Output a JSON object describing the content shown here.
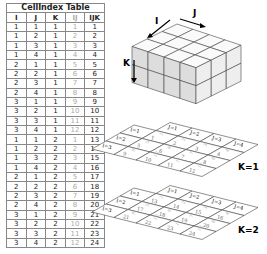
{
  "table": {
    "title": "CellIndex Table",
    "headers": [
      "I",
      "J",
      "K",
      "IJ",
      "IJK"
    ],
    "rows": [
      [
        1,
        1,
        1,
        1,
        1
      ],
      [
        1,
        2,
        1,
        2,
        2
      ],
      [
        1,
        3,
        1,
        3,
        3
      ],
      [
        1,
        4,
        1,
        4,
        4
      ],
      [
        2,
        1,
        1,
        5,
        5
      ],
      [
        2,
        2,
        1,
        6,
        6
      ],
      [
        2,
        3,
        1,
        7,
        7
      ],
      [
        2,
        4,
        1,
        8,
        8
      ],
      [
        3,
        1,
        1,
        9,
        9
      ],
      [
        3,
        2,
        1,
        10,
        10
      ],
      [
        3,
        3,
        1,
        11,
        11
      ],
      [
        3,
        4,
        1,
        12,
        12
      ],
      [
        1,
        1,
        2,
        1,
        13
      ],
      [
        1,
        2,
        2,
        2,
        14
      ],
      [
        1,
        3,
        2,
        3,
        15
      ],
      [
        1,
        4,
        2,
        4,
        16
      ],
      [
        2,
        1,
        2,
        5,
        17
      ],
      [
        2,
        2,
        2,
        6,
        18
      ],
      [
        2,
        3,
        2,
        7,
        19
      ],
      [
        2,
        4,
        2,
        8,
        20
      ],
      [
        3,
        1,
        2,
        9,
        21
      ],
      [
        3,
        2,
        2,
        10,
        22
      ],
      [
        3,
        3,
        2,
        11,
        23
      ],
      [
        3,
        4,
        2,
        12,
        24
      ]
    ]
  },
  "cube": {
    "axis_i": "I",
    "axis_j": "J",
    "axis_k": "K"
  },
  "layers": [
    {
      "label": "K=1",
      "row_labels": [
        "I=1",
        "I=2",
        "I=3"
      ],
      "col_labels": [
        "J=1",
        "J=2",
        "J=3",
        "J=4"
      ]
    },
    {
      "label": "K=2",
      "row_labels": [
        "I=1",
        "I=2",
        "I=3"
      ],
      "col_labels": [
        "J=1",
        "J=2",
        "J=3",
        "J=4"
      ]
    }
  ]
}
